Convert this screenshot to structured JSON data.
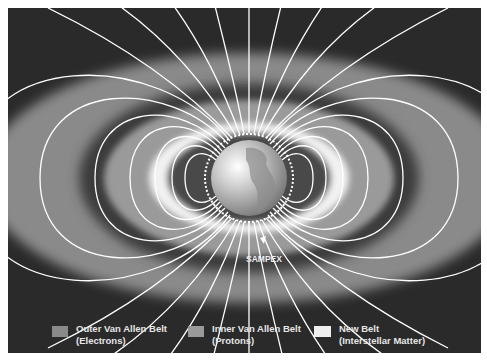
{
  "diagram": {
    "satellite_label": "SAMPEX",
    "colors": {
      "background": "#2a2a2a",
      "outer_belt": "#8a8a8a",
      "inner_belt": "#9a9a9a",
      "new_belt": "#f2f2f2",
      "field_lines": "#ffffff"
    }
  },
  "legend": {
    "items": [
      {
        "line1": "Outer Van Allen Belt",
        "line2": "(Electrons)",
        "swatch": "#8a8a8a"
      },
      {
        "line1": "Inner Van Allen Belt",
        "line2": "(Protons)",
        "swatch": "#9a9a9a"
      },
      {
        "line1": "New Belt",
        "line2": "(Interstellar Matter)",
        "swatch": "#efefef"
      }
    ]
  }
}
